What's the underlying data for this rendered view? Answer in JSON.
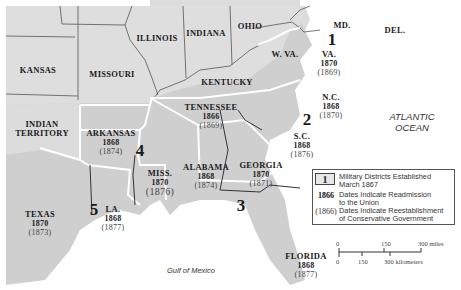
{
  "states_non_confederate": [
    "KANSAS",
    "MISSOURI",
    "ILLINOIS",
    "INDIANA",
    "OHIO",
    "KENTUCKY",
    "W. VA.",
    "MD.",
    "DEL.",
    "INDIAN TERRITORY"
  ],
  "states_confederate": [
    {
      "name": "VA.",
      "readmission": "1870",
      "conservative": "(1869)"
    },
    {
      "name": "N.C.",
      "readmission": "1868",
      "conservative": "(1870)"
    },
    {
      "name": "TENNESSEE",
      "readmission": "1866",
      "conservative": "(1869)"
    },
    {
      "name": "S.C.",
      "readmission": "1868",
      "conservative": "(1876)"
    },
    {
      "name": "ARKANSAS",
      "readmission": "1868",
      "conservative": "(1874)"
    },
    {
      "name": "MISS.",
      "readmission": "1870",
      "conservative": "(1876)"
    },
    {
      "name": "ALABAMA",
      "readmission": "1868",
      "conservative": "(1874)"
    },
    {
      "name": "GEORGIA",
      "readmission": "1870",
      "conservative": "(1871)"
    },
    {
      "name": "TEXAS",
      "readmission": "1870",
      "conservative": "(1873)"
    },
    {
      "name": "LA.",
      "readmission": "1868",
      "conservative": "(1877)"
    },
    {
      "name": "FLORIDA",
      "readmission": "1868",
      "conservative": "(1877)"
    }
  ],
  "military_districts": [
    "1",
    "2",
    "3",
    "4",
    "5"
  ],
  "water": {
    "ocean_line1": "ATLANTIC",
    "ocean_line2": "OCEAN",
    "gulf": "Gulf of Mexico"
  },
  "legend": {
    "box_key": "1",
    "box_text_1": "Military Districts Established",
    "box_text_2": "March 1867",
    "bold_key": "1866",
    "bold_text_1": "Dates Indicate Readmission",
    "bold_text_2": "to the Union",
    "paren_key": "(1866)",
    "paren_text_1": "Dates Indicate Reestablishment",
    "paren_text_2": "of Conservative Government"
  },
  "scale": {
    "mi_0": "0",
    "mi_150": "150",
    "mi_300": "300 miles",
    "km_0": "0",
    "km_150": "150",
    "km_300": "300 kilometers"
  },
  "colors": {
    "union": "#d9d9d9",
    "confederate": "#c4c4c4",
    "water": "#ffffff",
    "border": "#444444",
    "region_border": "#ffffff"
  }
}
